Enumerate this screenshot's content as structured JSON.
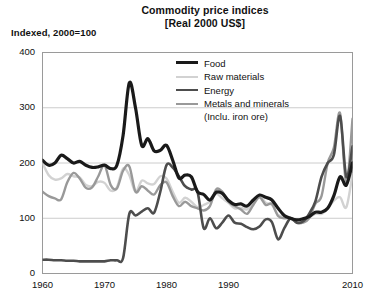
{
  "header": {
    "title": "Commodity price indices",
    "subtitle": "[Real 2000 US$]",
    "axis_note": "Indexed, 2000=100"
  },
  "legend": {
    "items": [
      {
        "label": "Food",
        "color": "#1a1a1a",
        "width": 3.2
      },
      {
        "label": "Raw materials",
        "color": "#d2d2d2",
        "width": 2.4
      },
      {
        "label": "Energy",
        "color": "#4d4d4d",
        "width": 2.6
      },
      {
        "label": "Metals and minerals",
        "sublabel": "(Inclu. iron ore)",
        "color": "#999999",
        "width": 2.4
      }
    ]
  },
  "chart_data": {
    "type": "line",
    "title": "Commodity price indices",
    "subtitle": "[Real 2000 US$]",
    "xlabel": "",
    "ylabel": "Indexed, 2000=100",
    "xlim": [
      1960,
      2010
    ],
    "ylim": [
      0,
      400
    ],
    "yticks": [
      0,
      100,
      200,
      300,
      400
    ],
    "xticks": [
      1960,
      1970,
      1980,
      1990,
      2010
    ],
    "xtick_labels": [
      "1960",
      "1970",
      "1980",
      "1990",
      "2010"
    ],
    "grid": "horizontal",
    "legend_position": "top-right-inside",
    "x": [
      1960,
      1961,
      1962,
      1963,
      1964,
      1965,
      1966,
      1967,
      1968,
      1969,
      1970,
      1971,
      1972,
      1973,
      1974,
      1975,
      1976,
      1977,
      1978,
      1979,
      1980,
      1981,
      1982,
      1983,
      1984,
      1985,
      1986,
      1987,
      1988,
      1989,
      1990,
      1991,
      1992,
      1993,
      1994,
      1995,
      1996,
      1997,
      1998,
      1999,
      2000,
      2001,
      2002,
      2003,
      2004,
      2005,
      2006,
      2007,
      2008,
      2009,
      2010
    ],
    "series": [
      {
        "name": "Food",
        "color": "#1a1a1a",
        "width": 3.2,
        "values": [
          205,
          196,
          200,
          214,
          208,
          200,
          203,
          196,
          192,
          193,
          196,
          190,
          196,
          250,
          345,
          300,
          232,
          244,
          222,
          223,
          232,
          205,
          173,
          178,
          175,
          148,
          143,
          133,
          147,
          145,
          132,
          125,
          126,
          122,
          133,
          142,
          138,
          133,
          118,
          105,
          100,
          97,
          99,
          103,
          111,
          111,
          118,
          141,
          175,
          160,
          200
        ]
      },
      {
        "name": "Raw materials",
        "color": "#d2d2d2",
        "width": 2.4,
        "values": [
          200,
          178,
          170,
          172,
          180,
          176,
          174,
          160,
          158,
          166,
          164,
          150,
          156,
          190,
          178,
          148,
          168,
          163,
          162,
          176,
          172,
          148,
          128,
          137,
          130,
          120,
          124,
          130,
          144,
          136,
          128,
          118,
          119,
          116,
          128,
          140,
          128,
          124,
          106,
          103,
          100,
          93,
          95,
          101,
          108,
          108,
          118,
          132,
          138,
          120,
          180
        ]
      },
      {
        "name": "Energy",
        "color": "#4d4d4d",
        "width": 2.6,
        "values": [
          25,
          25,
          24,
          24,
          23,
          23,
          22,
          22,
          22,
          22,
          22,
          24,
          24,
          28,
          108,
          105,
          112,
          118,
          110,
          148,
          196,
          192,
          176,
          158,
          152,
          148,
          82,
          100,
          82,
          92,
          105,
          92,
          90,
          84,
          80,
          85,
          98,
          93,
          62,
          82,
          100,
          92,
          94,
          108,
          130,
          175,
          200,
          215,
          285,
          175,
          230
        ]
      },
      {
        "name": "Metals and minerals",
        "color": "#999999",
        "width": 2.4,
        "values": [
          148,
          140,
          136,
          134,
          165,
          182,
          172,
          155,
          156,
          176,
          196,
          160,
          154,
          186,
          194,
          148,
          158,
          150,
          143,
          160,
          165,
          140,
          122,
          130,
          122,
          118,
          114,
          122,
          152,
          148,
          130,
          122,
          116,
          108,
          124,
          138,
          124,
          126,
          104,
          100,
          100,
          92,
          92,
          100,
          126,
          140,
          200,
          228,
          290,
          160,
          280
        ]
      }
    ]
  }
}
